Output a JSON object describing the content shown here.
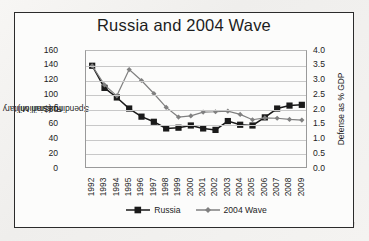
{
  "chart_data": {
    "type": "line",
    "title": "Russia and 2004 Wave",
    "xlabel": "",
    "ylabel": "Russian Military Spending ($million)",
    "y2label": "Defense as % GDP",
    "categories": [
      "1992",
      "1993",
      "1994",
      "1995",
      "1996",
      "1997",
      "1998",
      "1999",
      "2000",
      "2001",
      "2002",
      "2003",
      "2004",
      "2005",
      "2006",
      "2007",
      "2008",
      "2009"
    ],
    "ylim": [
      0,
      160
    ],
    "y2lim": [
      0.0,
      4.0
    ],
    "yticks": [
      "0",
      "20",
      "40",
      "60",
      "80",
      "100",
      "120",
      "140",
      "160"
    ],
    "y2ticks": [
      "0.0",
      "0.5",
      "1.0",
      "1.5",
      "2.0",
      "2.5",
      "3.0",
      "3.5",
      "4.0"
    ],
    "grid": true,
    "legend_position": "bottom",
    "series": [
      {
        "name": "Russia",
        "axis": "left",
        "units": "$million",
        "color": "#1a1a1a",
        "marker": "square",
        "values": [
          140,
          110,
          97,
          82,
          71,
          64,
          55,
          56,
          59,
          55,
          53,
          65,
          60,
          59,
          70,
          82,
          86,
          87
        ]
      },
      {
        "name": "2004 Wave",
        "axis": "right",
        "units": "% GDP",
        "color": "#808080",
        "marker": "diamond",
        "values": [
          3.5,
          2.85,
          2.48,
          3.37,
          3.0,
          2.56,
          2.09,
          1.76,
          1.8,
          1.93,
          1.94,
          1.96,
          1.85,
          1.67,
          1.73,
          1.72,
          1.68,
          1.66
        ]
      }
    ]
  },
  "axes": {
    "left_title_line1": "Russian Military",
    "left_title_line2": "Spending ($million)",
    "right_title": "Defense as % GDP"
  }
}
